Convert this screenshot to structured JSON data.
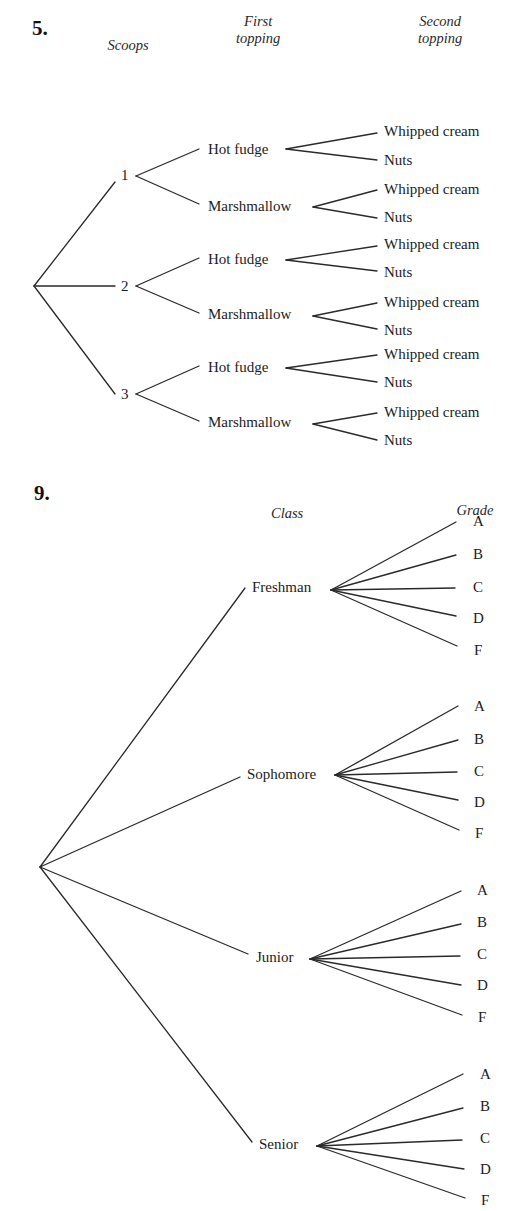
{
  "problem5": {
    "number": "5.",
    "number_pos": [
      32,
      18
    ],
    "headers": [
      {
        "text": "Scoops",
        "x": 128,
        "y": 37,
        "lines": [
          "Scoops"
        ]
      },
      {
        "text": "First topping",
        "x": 258,
        "y": 13,
        "lines": [
          "First",
          "topping"
        ]
      },
      {
        "text": "Second topping",
        "x": 440,
        "y": 13,
        "lines": [
          "Second",
          "topping"
        ]
      }
    ],
    "root": [
      34,
      286
    ],
    "scoops": [
      {
        "label": "1",
        "label_pos": [
          121,
          168
        ],
        "line_end": [
          115,
          182
        ],
        "fan": [
          136,
          176
        ],
        "toppings": [
          {
            "label": "Hot fudge",
            "label_pos": [
              208,
              142
            ],
            "line_end": [
              199,
              149
            ],
            "fan": [
              286,
              149
            ],
            "seconds": [
              {
                "label": "Whipped cream",
                "label_pos": [
                  384,
                  124
                ],
                "line_end": [
                  377,
                  133
                ]
              },
              {
                "label": "Nuts",
                "label_pos": [
                  384,
                  153
                ],
                "line_end": [
                  377,
                  160
                ]
              }
            ]
          },
          {
            "label": "Marshmallow",
            "label_pos": [
              208,
              199
            ],
            "line_end": [
              199,
              204
            ],
            "fan": [
              313,
              207
            ],
            "seconds": [
              {
                "label": "Whipped cream",
                "label_pos": [
                  384,
                  182
                ],
                "line_end": [
                  377,
                  190
                ]
              },
              {
                "label": "Nuts",
                "label_pos": [
                  384,
                  210
                ],
                "line_end": [
                  377,
                  218
                ]
              }
            ]
          }
        ]
      },
      {
        "label": "2",
        "label_pos": [
          121,
          279
        ],
        "line_end": [
          115,
          286
        ],
        "fan": [
          136,
          286
        ],
        "toppings": [
          {
            "label": "Hot fudge",
            "label_pos": [
              208,
              252
            ],
            "line_end": [
              199,
              258
            ],
            "fan": [
              286,
              260
            ],
            "seconds": [
              {
                "label": "Whipped cream",
                "label_pos": [
                  384,
                  237
                ],
                "line_end": [
                  377,
                  246
                ]
              },
              {
                "label": "Nuts",
                "label_pos": [
                  384,
                  265
                ],
                "line_end": [
                  377,
                  271
                ]
              }
            ]
          },
          {
            "label": "Marshmallow",
            "label_pos": [
              208,
              307
            ],
            "line_end": [
              199,
              313
            ],
            "fan": [
              313,
              316
            ],
            "seconds": [
              {
                "label": "Whipped cream",
                "label_pos": [
                  384,
                  295
                ],
                "line_end": [
                  377,
                  303
                ]
              },
              {
                "label": "Nuts",
                "label_pos": [
                  384,
                  323
                ],
                "line_end": [
                  377,
                  329
                ]
              }
            ]
          }
        ]
      },
      {
        "label": "3",
        "label_pos": [
          121,
          387
        ],
        "line_end": [
          115,
          394
        ],
        "fan": [
          136,
          394
        ],
        "toppings": [
          {
            "label": "Hot fudge",
            "label_pos": [
              208,
              360
            ],
            "line_end": [
              199,
              366
            ],
            "fan": [
              286,
              368
            ],
            "seconds": [
              {
                "label": "Whipped cream",
                "label_pos": [
                  384,
                  347
                ],
                "line_end": [
                  377,
                  355
                ]
              },
              {
                "label": "Nuts",
                "label_pos": [
                  384,
                  375
                ],
                "line_end": [
                  377,
                  382
                ]
              }
            ]
          },
          {
            "label": "Marshmallow",
            "label_pos": [
              208,
              415
            ],
            "line_end": [
              199,
              421
            ],
            "fan": [
              313,
              424
            ],
            "seconds": [
              {
                "label": "Whipped cream",
                "label_pos": [
                  384,
                  405
                ],
                "line_end": [
                  377,
                  413
                ]
              },
              {
                "label": "Nuts",
                "label_pos": [
                  384,
                  433
                ],
                "line_end": [
                  377,
                  440
                ]
              }
            ]
          }
        ]
      }
    ]
  },
  "problem9": {
    "number": "9.",
    "number_pos": [
      34,
      483
    ],
    "headers": [
      {
        "text": "Class",
        "x": 287,
        "y": 505,
        "lines": [
          "Class"
        ]
      },
      {
        "text": "Grade",
        "x": 475,
        "y": 502,
        "lines": [
          "Grade"
        ]
      }
    ],
    "root": [
      40,
      867
    ],
    "classes": [
      {
        "label": "Freshman",
        "label_pos": [
          252,
          580
        ],
        "line_end": [
          245,
          588
        ],
        "fan": [
          331,
          590
        ],
        "grades": [
          {
            "label": "A",
            "label_pos": [
              473,
              514
            ],
            "line_end": [
              456,
              522
            ]
          },
          {
            "label": "B",
            "label_pos": [
              473,
              547
            ],
            "line_end": [
              456,
              555
            ]
          },
          {
            "label": "C",
            "label_pos": [
              473,
              580
            ],
            "line_end": [
              455,
              588
            ]
          },
          {
            "label": "D",
            "label_pos": [
              473,
              611
            ],
            "line_end": [
              456,
              616
            ]
          },
          {
            "label": "F",
            "label_pos": [
              474,
              643
            ],
            "line_end": [
              457,
              646
            ]
          }
        ]
      },
      {
        "label": "Sophomore",
        "label_pos": [
          247,
          767
        ],
        "line_end": [
          240,
          777
        ],
        "fan": [
          335,
          775
        ],
        "grades": [
          {
            "label": "A",
            "label_pos": [
              474,
              699
            ],
            "line_end": [
              458,
              706
            ]
          },
          {
            "label": "B",
            "label_pos": [
              474,
              732
            ],
            "line_end": [
              458,
              740
            ]
          },
          {
            "label": "C",
            "label_pos": [
              474,
              764
            ],
            "line_end": [
              457,
              772
            ]
          },
          {
            "label": "D",
            "label_pos": [
              474,
              795
            ],
            "line_end": [
              458,
              800
            ]
          },
          {
            "label": "F",
            "label_pos": [
              475,
              826
            ],
            "line_end": [
              459,
              830
            ]
          }
        ]
      },
      {
        "label": "Junior",
        "label_pos": [
          256,
          950
        ],
        "line_end": [
          248,
          954
        ],
        "fan": [
          310,
          959
        ],
        "grades": [
          {
            "label": "A",
            "label_pos": [
              477,
              883
            ],
            "line_end": [
              461,
              891
            ]
          },
          {
            "label": "B",
            "label_pos": [
              477,
              915
            ],
            "line_end": [
              461,
              924
            ]
          },
          {
            "label": "C",
            "label_pos": [
              477,
              947
            ],
            "line_end": [
              460,
              956
            ]
          },
          {
            "label": "D",
            "label_pos": [
              477,
              978
            ],
            "line_end": [
              461,
              985
            ]
          },
          {
            "label": "F",
            "label_pos": [
              478,
              1010
            ],
            "line_end": [
              462,
              1015
            ]
          }
        ]
      },
      {
        "label": "Senior",
        "label_pos": [
          259,
          1137
        ],
        "line_end": [
          252,
          1142
        ],
        "fan": [
          317,
          1146
        ],
        "grades": [
          {
            "label": "A",
            "label_pos": [
              480,
              1067
            ],
            "line_end": [
              463,
              1074
            ]
          },
          {
            "label": "B",
            "label_pos": [
              480,
              1099
            ],
            "line_end": [
              463,
              1108
            ]
          },
          {
            "label": "C",
            "label_pos": [
              480,
              1131
            ],
            "line_end": [
              462,
              1140
            ]
          },
          {
            "label": "D",
            "label_pos": [
              480,
              1162
            ],
            "line_end": [
              464,
              1169
            ]
          },
          {
            "label": "F",
            "label_pos": [
              481,
              1193
            ],
            "line_end": [
              465,
              1198
            ]
          }
        ]
      }
    ]
  }
}
